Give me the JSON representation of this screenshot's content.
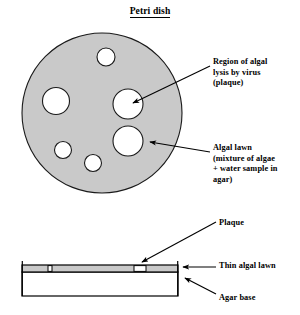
{
  "figure": {
    "title": "Petri dish",
    "title_underlined": true,
    "colors": {
      "agar_fill": "#c9c9c9",
      "plaque_fill": "#ffffff",
      "outline": "#000000",
      "background": "#ffffff"
    }
  },
  "top_view": {
    "name": "petri-dish-top-view",
    "dish": {
      "cx": 102,
      "cy": 113,
      "r": 80,
      "fill": "#c9c9c9"
    },
    "plaques": [
      {
        "id": "plaque-top",
        "cx": 106,
        "cy": 57,
        "r": 9
      },
      {
        "id": "plaque-left",
        "cx": 56,
        "cy": 101,
        "r": 13.5
      },
      {
        "id": "plaque-center-right",
        "cx": 128,
        "cy": 104,
        "r": 15
      },
      {
        "id": "plaque-lower-right",
        "cx": 128,
        "cy": 141,
        "r": 15
      },
      {
        "id": "plaque-lower-left",
        "cx": 63,
        "cy": 150,
        "r": 8.5
      },
      {
        "id": "plaque-bottom",
        "cx": 93,
        "cy": 163,
        "r": 8.5
      }
    ]
  },
  "side_view": {
    "name": "petri-dish-side-view",
    "lawn_strip": {
      "x": 22,
      "y": 265,
      "width": 156,
      "height": 7
    },
    "agar_box": {
      "x": 22,
      "y": 272,
      "width": 156,
      "height": 24
    },
    "plaque_gaps": [
      {
        "id": "plaque-gap-small",
        "x": 48,
        "width": 4
      },
      {
        "id": "plaque-gap-large",
        "x": 134,
        "width": 12
      }
    ]
  },
  "labels": {
    "region_of_lysis": [
      "Region of  algal",
      "lysis by virus",
      "(plaque)"
    ],
    "algal_lawn": [
      "Algal lawn",
      "(mixture of algae",
      "+ water sample in",
      "agar)"
    ],
    "plaque": "Plaque",
    "thin_algal_lawn": "Thin algal lawn",
    "agar_base": "Agar base"
  },
  "leader_lines": [
    {
      "name": "leader-region-of-lysis",
      "from": [
        210,
        66
      ],
      "to": [
        131,
        104
      ]
    },
    {
      "name": "leader-algal-lawn",
      "from": [
        210,
        152
      ],
      "to": [
        148,
        142
      ]
    },
    {
      "name": "leader-plaque",
      "from": [
        216,
        222
      ],
      "to": [
        141,
        262
      ]
    },
    {
      "name": "leader-thin-algal-lawn",
      "from": [
        216,
        266
      ],
      "to": [
        182,
        266
      ]
    },
    {
      "name": "leader-agar-base",
      "from": [
        216,
        294
      ],
      "to": [
        184,
        277
      ]
    }
  ]
}
